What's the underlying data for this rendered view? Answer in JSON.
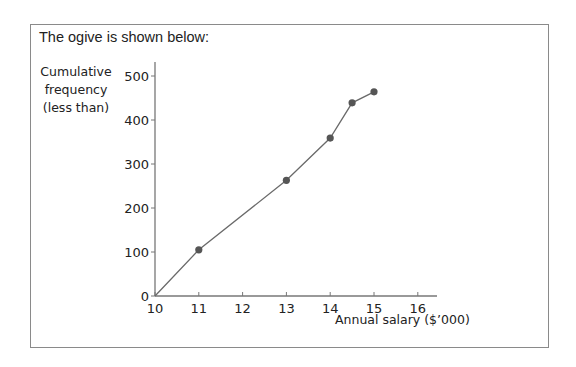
{
  "intro_text": "The ogive is shown below:",
  "chart_data": {
    "type": "line",
    "title": "",
    "xlabel": "Annual salary ($’000)",
    "ylabel": "Cumulative frequency (less than)",
    "ylabel_lines": [
      "Cumulative",
      "frequency",
      "(less than)"
    ],
    "x": [
      10,
      11,
      13,
      14,
      14.5,
      15
    ],
    "values": [
      0,
      105,
      263,
      359,
      439,
      464
    ],
    "x_ticks": [
      "10",
      "11",
      "12",
      "13",
      "14",
      "15",
      "16"
    ],
    "y_ticks": [
      "0",
      "100",
      "200",
      "300",
      "400",
      "500"
    ],
    "xlim": [
      10,
      16.5
    ],
    "ylim": [
      0,
      530
    ],
    "grid": false,
    "legend": null,
    "markers": true,
    "line_color": "#6a6a6a",
    "marker_color": "#555555"
  }
}
